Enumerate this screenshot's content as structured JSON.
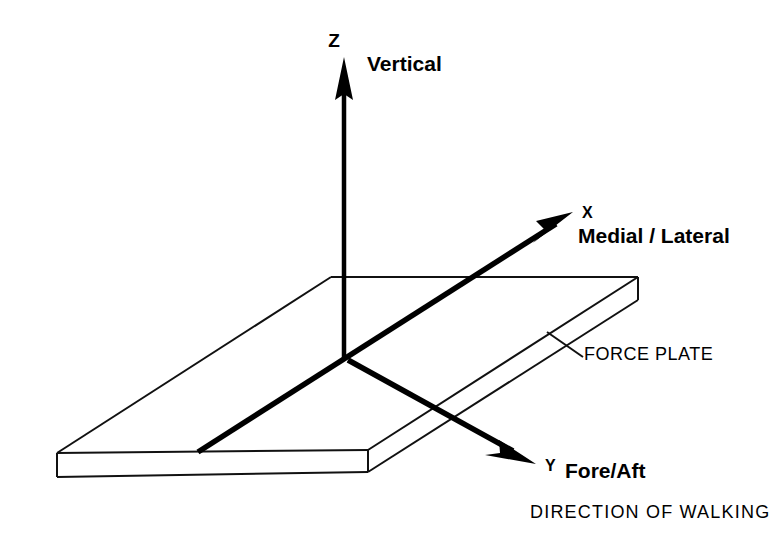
{
  "figure": {
    "background_color": "#ffffff",
    "line_color": "#000000"
  },
  "axes": {
    "z": {
      "symbol": "Z",
      "description": "Vertical",
      "direction": "up"
    },
    "x": {
      "symbol": "X",
      "description": "Medial / Lateral",
      "direction": "up-right"
    },
    "y": {
      "symbol": "Y",
      "description": "Fore/Aft",
      "direction": "down-right"
    }
  },
  "annotations": {
    "plate_label": "FORCE PLATE",
    "caption": "DIRECTION OF WALKING"
  }
}
